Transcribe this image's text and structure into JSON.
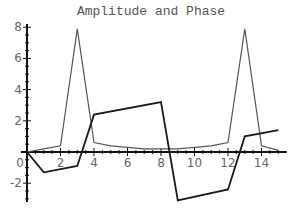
{
  "chart_data": {
    "type": "line",
    "title": "Amplitude and Phase",
    "xlabel": "",
    "ylabel": "",
    "xlim": [
      0,
      15.5
    ],
    "ylim": [
      -3.2,
      8.2
    ],
    "grid": false,
    "legend": null,
    "x_ticks": [
      "0",
      "2",
      "4",
      "6",
      "8",
      "10",
      "12",
      "14"
    ],
    "y_ticks": [
      "-2",
      "0",
      "2",
      "4",
      "6",
      "8"
    ],
    "series": [
      {
        "name": "Amplitude",
        "color": "#555555",
        "x": [
          0,
          1,
          2,
          3,
          4,
          5,
          6,
          7,
          8,
          9,
          10,
          11,
          12,
          13,
          14,
          15
        ],
        "values": [
          0,
          0.2,
          0.4,
          7.9,
          0.6,
          0.4,
          0.3,
          0.2,
          0.2,
          0.2,
          0.3,
          0.4,
          0.6,
          7.9,
          0.4,
          0.1
        ]
      },
      {
        "name": "Phase",
        "color": "#1a1a1a",
        "x": [
          0,
          1,
          3,
          4,
          8,
          9,
          12,
          13,
          15
        ],
        "values": [
          0,
          -1.3,
          -0.9,
          2.4,
          3.2,
          -3.1,
          -2.4,
          1.0,
          1.4
        ]
      }
    ]
  }
}
